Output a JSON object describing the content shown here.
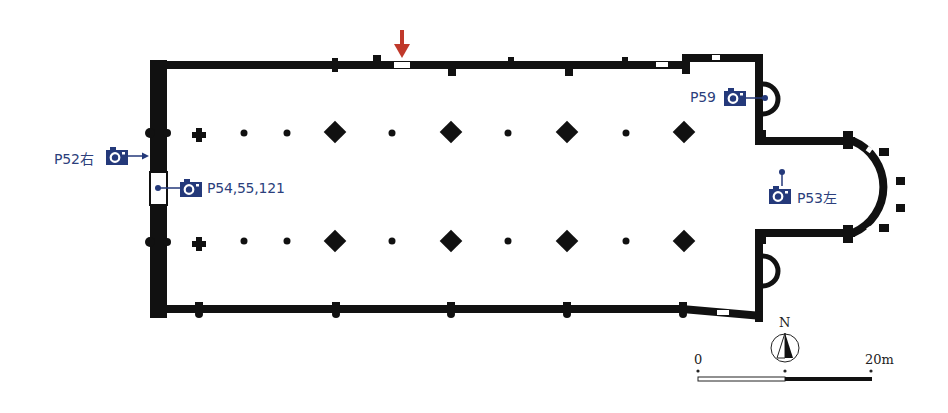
{
  "diagram": {
    "type": "church floor plan",
    "colors": {
      "wall": "#111111",
      "camera": "#24397a",
      "label": "#2c3f7c",
      "entrance_arrow": "#c0392b"
    },
    "photo_markers": [
      {
        "id": "p52",
        "label": "P52右",
        "icon": "camera-icon",
        "points_to": "west facade"
      },
      {
        "id": "p54",
        "label": "P54,55,121",
        "icon": "camera-icon",
        "points_to": "west entrance"
      },
      {
        "id": "p59",
        "label": "P59",
        "icon": "camera-icon",
        "points_to": "north apsidiole"
      },
      {
        "id": "p53",
        "label": "P53左",
        "icon": "camera-icon",
        "points_to": "choir"
      }
    ],
    "entrance_marker": {
      "icon": "arrow-down-icon",
      "position": "north wall"
    },
    "north_arrow": {
      "label": "N"
    },
    "scale_bar": {
      "start_label": "0",
      "end_label": "20m"
    }
  }
}
